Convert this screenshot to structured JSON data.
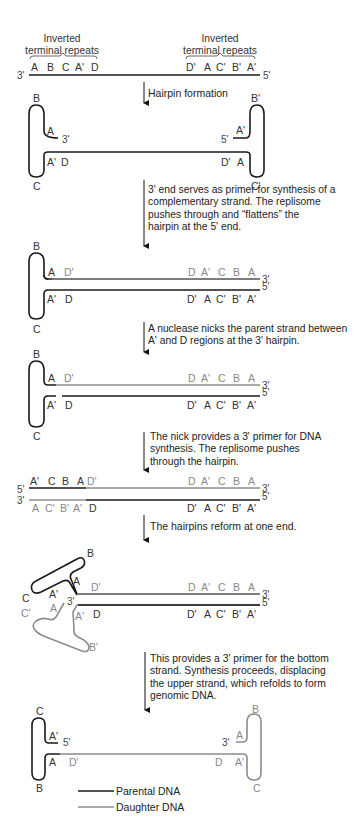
{
  "colors": {
    "parental": "#1a1a1a",
    "daughter": "#8c8c8c",
    "text": "#222222"
  },
  "header": {
    "left_label_line1": "Inverted",
    "left_label_line2": "terminal repeats",
    "right_label_line1": "Inverted",
    "right_label_line2": "terminal repeats"
  },
  "step0": {
    "end_left": "3'",
    "end_right": "5'",
    "left_seq": [
      "A",
      "B",
      "C",
      "A'",
      "D"
    ],
    "right_seq": [
      "D'",
      "A",
      "C'",
      "B'",
      "A'"
    ]
  },
  "captions": {
    "c1": "Hairpin formation",
    "c2_lines": [
      "3' end serves as primer for synthesis of a",
      "complementary strand. The replisome",
      "pushes through and “flattens” the",
      "hairpin at the 5' end."
    ],
    "c3_lines": [
      "A nuclease nicks the parent strand between",
      "A' and D regions at the 3' hairpin."
    ],
    "c4_lines": [
      "The nick provides a 3' primer for DNA",
      "synthesis. The replisome pushes",
      "through the hairpin."
    ],
    "c5": "The hairpins reform at one end.",
    "c6_lines": [
      "This provides a 3' primer for the bottom",
      "strand. Synthesis proceeds, displacing",
      "the upper strand, which refolds to form",
      "genomic DNA."
    ]
  },
  "step1": {
    "left_top": "B",
    "left_bottom": "C",
    "left_inner_top": "A",
    "left_end": "3'",
    "left_inner_bottom": "A'",
    "left_d": "D",
    "right_top": "B'",
    "right_bottom": "C'",
    "right_inner_top": "A'",
    "right_end": "5'",
    "right_inner_bottom": "A",
    "right_d": "D'"
  },
  "step2": {
    "hairpin_top": "B",
    "hairpin_bottom": "C",
    "top_left": [
      "A",
      "D'"
    ],
    "top_right": [
      "D",
      "A'",
      "C",
      "B",
      "A"
    ],
    "top_end": "3'",
    "bottom_left": [
      "A'",
      "D"
    ],
    "bottom_right": [
      "D'",
      "A",
      "C'",
      "B'",
      "A'"
    ],
    "bottom_end": "5'"
  },
  "step3": {
    "hairpin_top": "B",
    "hairpin_bottom": "C",
    "top_left": [
      "A",
      "D'"
    ],
    "top_right": [
      "D",
      "A'",
      "C",
      "B",
      "A"
    ],
    "top_end": "3'",
    "bottom_left": [
      "A'",
      "D"
    ],
    "bottom_right": [
      "D'",
      "A",
      "C'",
      "B'",
      "A'"
    ],
    "bottom_end": "5'"
  },
  "step4": {
    "top_start": "5'",
    "top_seq_left": [
      "A'",
      "C",
      "B",
      "A"
    ],
    "top_d": "D'",
    "top_right": [
      "D",
      "A'",
      "C",
      "B",
      "A"
    ],
    "top_end": "3'",
    "bottom_start": "3'",
    "bottom_seq_left": [
      "A",
      "C'",
      "B'",
      "A'"
    ],
    "bottom_d": "D",
    "bottom_right": [
      "D'",
      "A",
      "C'",
      "B'",
      "A'"
    ],
    "bottom_end": "5'"
  },
  "step5": {
    "upper_b": "B",
    "upper_c": "C",
    "upper_a": "A",
    "upper_ap": "A'",
    "mid_3": "3'",
    "lower_c": "C'",
    "lower_b": "B'",
    "lower_a": "A",
    "lower_ap": "A'",
    "top_dp": "D'",
    "bottom_d": "D",
    "top_right": [
      "D",
      "A'",
      "C",
      "B",
      "A"
    ],
    "top_end": "3'",
    "bottom_right": [
      "D'",
      "A",
      "C'",
      "B'",
      "A'"
    ],
    "bottom_end": "5'"
  },
  "step6": {
    "left_top": "C",
    "left_bottom": "B",
    "left_inner_top": "A'",
    "left_end": "5'",
    "left_inner_bottom": "A",
    "left_dp": "D'",
    "right_top": "B",
    "right_bottom": "C",
    "right_inner_top": "A",
    "right_end": "3'",
    "right_inner_bottom": "A'",
    "right_d": "D"
  },
  "legend": {
    "parental": "Parental DNA",
    "daughter": "Daughter DNA"
  }
}
